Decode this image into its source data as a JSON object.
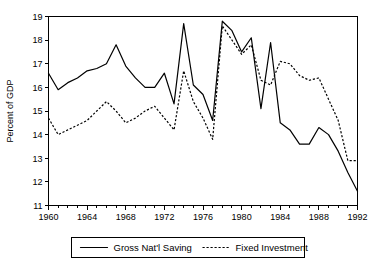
{
  "chart_data": {
    "type": "line",
    "title": "",
    "xlabel": "",
    "ylabel": "Percent of GDP",
    "xlim": [
      1960,
      1992
    ],
    "ylim": [
      11,
      19
    ],
    "ytick_labels": [
      "11",
      "12",
      "13",
      "14",
      "15",
      "16",
      "17",
      "18",
      "19"
    ],
    "ytick_values": [
      11,
      12,
      13,
      14,
      15,
      16,
      17,
      18,
      19
    ],
    "xtick_labels": [
      "1960",
      "1964",
      "1968",
      "1972",
      "1976",
      "1980",
      "1984",
      "1988",
      "1992"
    ],
    "xtick_values": [
      1960,
      1964,
      1968,
      1972,
      1976,
      1980,
      1984,
      1988,
      1992
    ],
    "minor_xticks_every": 1,
    "grid": false,
    "legend_position": "below-center",
    "x": [
      1960,
      1961,
      1962,
      1963,
      1964,
      1965,
      1966,
      1967,
      1968,
      1969,
      1970,
      1971,
      1972,
      1973,
      1974,
      1975,
      1976,
      1977,
      1978,
      1979,
      1980,
      1981,
      1982,
      1983,
      1984,
      1985,
      1986,
      1987,
      1988,
      1989,
      1990,
      1991,
      1992
    ],
    "series": [
      {
        "name": "Gross Nat'l Saving",
        "style": "solid",
        "values": [
          16.6,
          15.9,
          16.2,
          16.4,
          16.7,
          16.8,
          17.0,
          17.8,
          16.9,
          16.4,
          16.0,
          16.0,
          16.6,
          15.3,
          18.7,
          16.1,
          15.7,
          14.6,
          18.8,
          18.4,
          17.5,
          18.1,
          15.1,
          17.9,
          14.5,
          14.2,
          13.6,
          13.6,
          14.3,
          14.0,
          13.3,
          12.4,
          11.6
        ]
      },
      {
        "name": "Fixed Investment",
        "style": "dotted",
        "values": [
          14.7,
          14.0,
          14.2,
          14.4,
          14.6,
          15.0,
          15.4,
          15.0,
          14.5,
          14.7,
          15.0,
          15.2,
          14.7,
          14.2,
          16.7,
          15.4,
          14.7,
          13.8,
          18.6,
          18.0,
          17.4,
          17.8,
          16.3,
          16.1,
          17.1,
          17.0,
          16.5,
          16.3,
          16.4,
          15.5,
          14.6,
          12.9,
          12.9
        ]
      }
    ],
    "series_label_solid": "Gross Nat'l Saving",
    "series_label_dotted": "Fixed Investment"
  }
}
